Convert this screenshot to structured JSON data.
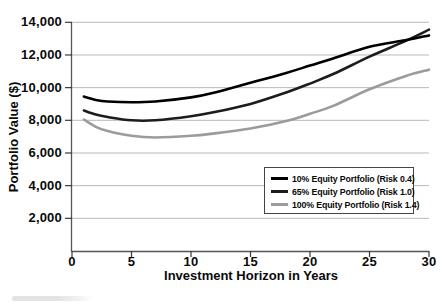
{
  "chart_data": {
    "type": "line",
    "title": "",
    "xlabel": "Investment Horizon in Years",
    "ylabel": "Portfolio Value ($)",
    "xlim": [
      0,
      30
    ],
    "ylim": [
      0,
      14000
    ],
    "xticks": [
      0,
      5,
      10,
      15,
      20,
      25,
      30
    ],
    "xtick_labels": [
      "0",
      "5",
      "10",
      "15",
      "20",
      "25",
      "30"
    ],
    "yticks": [
      2000,
      4000,
      6000,
      8000,
      10000,
      12000,
      14000
    ],
    "ytick_labels": [
      "2,000",
      "4,000",
      "6,000",
      "8,000",
      "10,000",
      "12,000",
      "14,000"
    ],
    "grid": "horizontal-only",
    "legend_position": "lower-right-inside",
    "x": [
      1,
      2,
      3,
      5,
      7,
      10,
      12,
      15,
      18,
      20,
      22,
      25,
      28,
      30
    ],
    "series": [
      {
        "name": "10% Equity Portfolio (Risk 0.4)",
        "color": "#000000",
        "values": [
          9450,
          9250,
          9150,
          9100,
          9150,
          9400,
          9700,
          10300,
          10900,
          11350,
          11800,
          12500,
          12900,
          13200
        ]
      },
      {
        "name": "65% Equity Portfolio (Risk 1.0)",
        "color": "#1c1c1c",
        "values": [
          8600,
          8350,
          8200,
          8000,
          8000,
          8250,
          8500,
          9000,
          9700,
          10250,
          10850,
          11900,
          12850,
          13550
        ]
      },
      {
        "name": "100% Equity Portfolio (Risk 1.4)",
        "color": "#9b9b9b",
        "values": [
          8050,
          7600,
          7350,
          7050,
          6950,
          7050,
          7200,
          7500,
          7950,
          8400,
          8900,
          9900,
          10700,
          11100
        ]
      }
    ]
  },
  "colors": {
    "gridline": "#b9b9b9",
    "axis": "#555555",
    "tick": "#3a3a3a",
    "background": "#ffffff",
    "legend_border": "#444444"
  }
}
